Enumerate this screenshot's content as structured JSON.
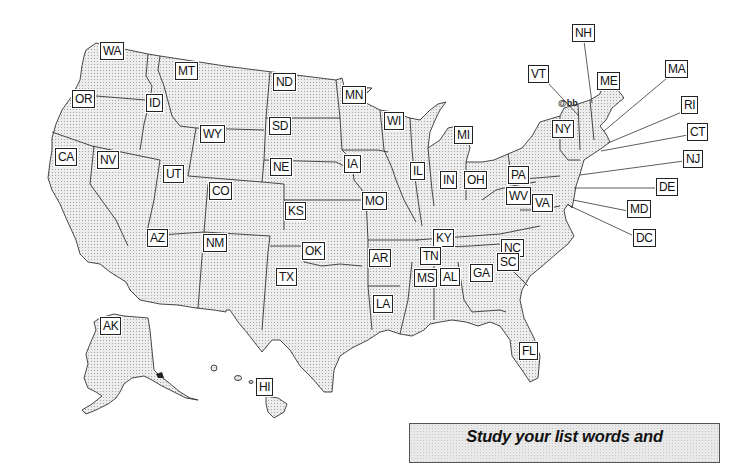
{
  "map": {
    "title": "United States",
    "fill_color": "#e6e6e6",
    "border_color": "#333333",
    "labels": [
      {
        "code": "WA",
        "x": 100,
        "y": 42
      },
      {
        "code": "MT",
        "x": 175,
        "y": 62
      },
      {
        "code": "ND",
        "x": 273,
        "y": 73
      },
      {
        "code": "MN",
        "x": 342,
        "y": 86
      },
      {
        "code": "OR",
        "x": 72,
        "y": 90
      },
      {
        "code": "ID",
        "x": 146,
        "y": 94
      },
      {
        "code": "WY",
        "x": 200,
        "y": 125
      },
      {
        "code": "SD",
        "x": 269,
        "y": 117
      },
      {
        "code": "CA",
        "x": 55,
        "y": 148
      },
      {
        "code": "NV",
        "x": 97,
        "y": 151
      },
      {
        "code": "UT",
        "x": 163,
        "y": 165
      },
      {
        "code": "NE",
        "x": 270,
        "y": 158
      },
      {
        "code": "IA",
        "x": 344,
        "y": 155
      },
      {
        "code": "CO",
        "x": 209,
        "y": 182
      },
      {
        "code": "KS",
        "x": 285,
        "y": 202
      },
      {
        "code": "MO",
        "x": 362,
        "y": 192
      },
      {
        "code": "AZ",
        "x": 147,
        "y": 229
      },
      {
        "code": "NM",
        "x": 203,
        "y": 234
      },
      {
        "code": "OK",
        "x": 302,
        "y": 242
      },
      {
        "code": "TX",
        "x": 276,
        "y": 268
      },
      {
        "code": "AR",
        "x": 369,
        "y": 249
      },
      {
        "code": "LA",
        "x": 373,
        "y": 295
      },
      {
        "code": "WI",
        "x": 384,
        "y": 112
      },
      {
        "code": "MI",
        "x": 454,
        "y": 126
      },
      {
        "code": "IL",
        "x": 410,
        "y": 162
      },
      {
        "code": "IN",
        "x": 440,
        "y": 171
      },
      {
        "code": "OH",
        "x": 464,
        "y": 171
      },
      {
        "code": "PA",
        "x": 508,
        "y": 166
      },
      {
        "code": "WV",
        "x": 506,
        "y": 187
      },
      {
        "code": "VA",
        "x": 532,
        "y": 194
      },
      {
        "code": "KY",
        "x": 433,
        "y": 229
      },
      {
        "code": "TN",
        "x": 420,
        "y": 247
      },
      {
        "code": "MS",
        "x": 414,
        "y": 269
      },
      {
        "code": "AL",
        "x": 440,
        "y": 268
      },
      {
        "code": "GA",
        "x": 470,
        "y": 264
      },
      {
        "code": "NC",
        "x": 501,
        "y": 239
      },
      {
        "code": "SC",
        "x": 497,
        "y": 253
      },
      {
        "code": "FL",
        "x": 519,
        "y": 342
      },
      {
        "code": "NY",
        "x": 552,
        "y": 120
      },
      {
        "code": "VT",
        "x": 528,
        "y": 65
      },
      {
        "code": "NH",
        "x": 572,
        "y": 24
      },
      {
        "code": "ME",
        "x": 597,
        "y": 72
      },
      {
        "code": "MA",
        "x": 665,
        "y": 60
      },
      {
        "code": "RI",
        "x": 681,
        "y": 96
      },
      {
        "code": "CT",
        "x": 687,
        "y": 123
      },
      {
        "code": "NJ",
        "x": 683,
        "y": 150
      },
      {
        "code": "DE",
        "x": 656,
        "y": 178
      },
      {
        "code": "MD",
        "x": 627,
        "y": 200
      },
      {
        "code": "DC",
        "x": 633,
        "y": 229
      },
      {
        "code": "AK",
        "x": 100,
        "y": 317
      },
      {
        "code": "HI",
        "x": 256,
        "y": 378
      }
    ],
    "leaders": [
      {
        "code": "VT",
        "x1": 547,
        "y1": 82,
        "x2": 578,
        "y2": 115
      },
      {
        "code": "NH",
        "x1": 584,
        "y1": 41,
        "x2": 592,
        "y2": 103
      },
      {
        "code": "MA",
        "x1": 667,
        "y1": 78,
        "x2": 604,
        "y2": 131
      },
      {
        "code": "RI",
        "x1": 682,
        "y1": 112,
        "x2": 608,
        "y2": 143
      },
      {
        "code": "CT",
        "x1": 688,
        "y1": 135,
        "x2": 601,
        "y2": 151
      },
      {
        "code": "NJ",
        "x1": 684,
        "y1": 161,
        "x2": 580,
        "y2": 175
      },
      {
        "code": "DE",
        "x1": 657,
        "y1": 188,
        "x2": 574,
        "y2": 188
      },
      {
        "code": "MD",
        "x1": 628,
        "y1": 211,
        "x2": 573,
        "y2": 200
      },
      {
        "code": "DC",
        "x1": 634,
        "y1": 236,
        "x2": 568,
        "y2": 205
      }
    ],
    "symbol_near_vt": "@bb"
  },
  "study_box": {
    "text": "Study your list words and"
  }
}
